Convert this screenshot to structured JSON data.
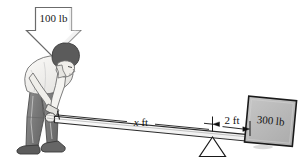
{
  "figure": {
    "background_color": "#ffffff",
    "width": 299,
    "height": 165
  },
  "labels": {
    "applied_force": "100 lb",
    "load_weight": "300 lb",
    "effort_arm": "x ft",
    "effort_arm_variable": "x",
    "effort_arm_unit": "ft",
    "load_arm": "2 ft"
  },
  "annotations": {
    "force_arrow": {
      "name": "downward-force-arrow",
      "label": "100 lb",
      "direction": "down"
    },
    "dimension_x": {
      "name": "dimension-x-ft",
      "label": "x ft",
      "from": "hand-grip-end",
      "to": "fulcrum"
    },
    "dimension_2ft": {
      "name": "dimension-2-ft",
      "label": "2 ft",
      "from": "fulcrum",
      "to": "load-block"
    }
  },
  "objects": {
    "person": {
      "name": "person-pushing-lever",
      "hair_color": "#4a4a4a",
      "shirt_color": "#f2f1ee",
      "pants_color": "#7c7c7c",
      "shoe_color": "#595959"
    },
    "lever": {
      "name": "lever-beam",
      "fill_color": "#f7f7f7",
      "stroke_color": "#2b2b2b"
    },
    "fulcrum": {
      "name": "fulcrum-triangle",
      "fill_color": "#ffffff",
      "stroke_color": "#1a1a1a"
    },
    "load_block": {
      "name": "load-block-300lb",
      "fill_color": "#b9b9b9",
      "stroke_color": "#1a1a1a"
    },
    "arrow": {
      "name": "force-arrow-shape",
      "fill_color": "#ffffff",
      "stroke_color": "#5a5a5a"
    }
  },
  "colors": {
    "ink": "#1a1a1a",
    "gray_mid": "#8a8a8a",
    "gray_light": "#d8d8d8",
    "white": "#ffffff"
  }
}
